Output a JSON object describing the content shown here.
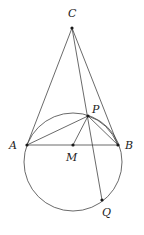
{
  "figure": {
    "type": "geometry",
    "points": {
      "C": {
        "label": "C"
      },
      "A": {
        "label": "A"
      },
      "B": {
        "label": "B"
      },
      "M": {
        "label": "M"
      },
      "P": {
        "label": "P"
      },
      "Q": {
        "label": "Q"
      }
    },
    "segments": [
      "CA",
      "CB",
      "CQ",
      "AB",
      "AP",
      "BP",
      "MP"
    ],
    "circle": {
      "through": [
        "A",
        "B",
        "P",
        "Q"
      ]
    },
    "arc": {
      "from": "P",
      "to": "B"
    }
  }
}
